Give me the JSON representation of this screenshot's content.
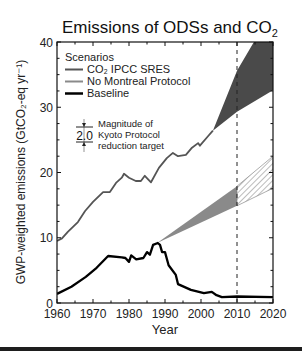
{
  "chart_data": {
    "type": "line",
    "title": "Emissions of ODSs and CO",
    "title_subscript": "2",
    "xlabel": "Year",
    "ylabel": "GWP-weighted emissions (GtCO₂-eq yr⁻¹)",
    "xlim": [
      1960,
      2020
    ],
    "ylim": [
      0,
      40
    ],
    "x_ticks": [
      1960,
      1970,
      1980,
      1990,
      2000,
      2010,
      2020
    ],
    "y_ticks": [
      0,
      10,
      20,
      30,
      40
    ],
    "grid": false,
    "legend": {
      "title": "Scenarios",
      "position": "upper-left",
      "entries": [
        {
          "label": "CO₂ IPCC SRES",
          "color": "#555555",
          "width": 2
        },
        {
          "label": "No Montreal Protocol",
          "color": "#8a8a8a",
          "width": 2
        },
        {
          "label": "Baseline",
          "color": "#000000",
          "width": 2.5
        }
      ]
    },
    "series": [
      {
        "name": "CO2 IPCC SRES",
        "color": "#555555",
        "x": [
          1960,
          1961.4,
          1963,
          1965.8,
          1967.8,
          1970,
          1972.8,
          1974.7,
          1976.4,
          1978,
          1978.6,
          1980,
          1981.9,
          1983.3,
          1984.4,
          1986.1,
          1988.3,
          1990.5,
          1992.2,
          1993.6,
          1995.8,
          1997.5,
          1999.2,
          1999.7,
          2002,
          2003.3
        ],
        "y": [
          9.5,
          9.9,
          10.9,
          12.4,
          14.1,
          15.5,
          17.0,
          17.0,
          18.4,
          19.2,
          19.8,
          19.2,
          18.7,
          18.7,
          19.5,
          18.5,
          20.7,
          22.2,
          23.0,
          22.5,
          22.7,
          23.8,
          24.5,
          24.1,
          25.6,
          26.4
        ]
      },
      {
        "name": "Baseline",
        "color": "#000000",
        "x": [
          1960,
          1964,
          1968,
          1971,
          1974.2,
          1978,
          1979,
          1980,
          1980.6,
          1982,
          1984,
          1985,
          1985.8,
          1986.7,
          1988,
          1988.6,
          1989.2,
          1990,
          1991,
          1993,
          1993.6,
          1997.2,
          2000.8,
          2003,
          2004.3,
          2005.8,
          2010,
          2020
        ],
        "y": [
          1.4,
          2.5,
          4.0,
          5.4,
          7.2,
          7.0,
          6.9,
          6.3,
          7.3,
          6.7,
          6.9,
          7.8,
          7.4,
          8.9,
          9.2,
          8.9,
          7.8,
          7.8,
          5.8,
          4.3,
          2.9,
          2.0,
          1.5,
          1.7,
          1.2,
          0.9,
          1.0,
          0.9
        ]
      }
    ],
    "bands": [
      {
        "name": "CO2 IPCC SRES projection",
        "fill": "#4a4a4a",
        "x0": 2003.3,
        "y0": 26.4,
        "upper": [
          [
            2010,
            35.6
          ],
          [
            2014.7,
            40.0
          ],
          [
            2020,
            40.0
          ]
        ],
        "lower": [
          [
            2010,
            29.3
          ],
          [
            2020,
            32.6
          ]
        ]
      },
      {
        "name": "No Montreal Protocol (to 2010)",
        "fill": "#8a8a8a",
        "x0": 1987.8,
        "y0": 9.2,
        "upper": [
          [
            2010,
            17.9
          ]
        ],
        "lower": [
          [
            2010,
            14.9
          ]
        ]
      },
      {
        "name": "No Montreal Protocol (2010-2020)",
        "fill": "hatched",
        "x0": 2010,
        "upper": [
          [
            2010,
            17.9
          ],
          [
            2020,
            22.5
          ]
        ],
        "lower": [
          [
            2010,
            14.9
          ],
          [
            2020,
            17.6
          ]
        ]
      }
    ],
    "annotations": [
      {
        "type": "vline",
        "x": 2010,
        "style": "dashed"
      },
      {
        "type": "bar-magnitude",
        "value": "2.0",
        "text": [
          "Magnitude of",
          "Kyoto Protocol",
          "reduction target"
        ]
      }
    ]
  }
}
